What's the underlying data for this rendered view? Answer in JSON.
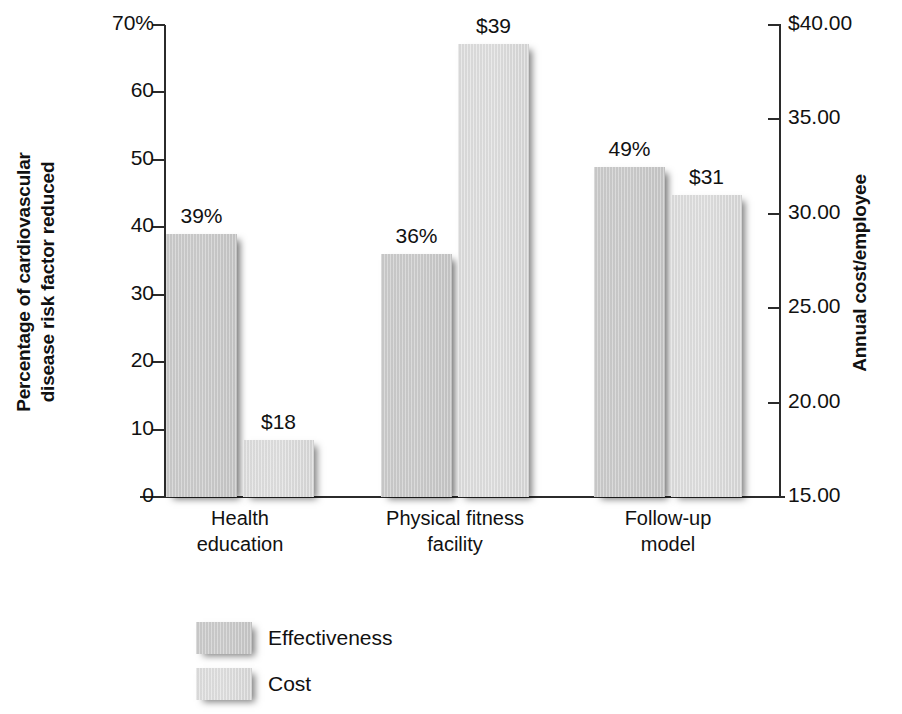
{
  "chart_data": {
    "type": "bar",
    "title": "",
    "categories": [
      "Health education",
      "Physical fitness facility",
      "Follow-up model"
    ],
    "category_lines": [
      [
        "Health",
        "education"
      ],
      [
        "Physical fitness",
        "facility"
      ],
      [
        "Follow-up",
        "model"
      ]
    ],
    "series": [
      {
        "name": "Effectiveness",
        "axis": "left",
        "values": [
          39,
          36,
          49
        ],
        "labels": [
          "39%",
          "36%",
          "49%"
        ],
        "color": "#c9c9c9"
      },
      {
        "name": "Cost",
        "axis": "right",
        "values": [
          18,
          39,
          31
        ],
        "labels": [
          "$18",
          "$39",
          "$31"
        ],
        "color": "#dadada"
      }
    ],
    "ylabel": "Percentage of cardiovascular disease risk factor reduced",
    "ylabel_lines": [
      "Percentage of cardiovascular",
      "disease risk factor reduced"
    ],
    "ylabel_right": "Annual cost/employee",
    "xlabel": "",
    "ylim": [
      0,
      70
    ],
    "ylim_right": [
      15,
      40
    ],
    "yticks": [
      "0",
      "10",
      "20",
      "30",
      "40",
      "50",
      "60",
      "70%"
    ],
    "ytick_values": [
      0,
      10,
      20,
      30,
      40,
      50,
      60,
      70
    ],
    "yticks_right": [
      "15.00",
      "20.00",
      "25.00",
      "30.00",
      "35.00",
      "$40.00"
    ],
    "ytick_right_values": [
      15,
      20,
      25,
      30,
      35,
      40
    ],
    "grid": false,
    "legend": {
      "position": "bottom-left",
      "entries": [
        "Effectiveness",
        "Cost"
      ]
    }
  }
}
